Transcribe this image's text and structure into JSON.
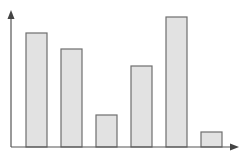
{
  "chart_data": {
    "type": "bar",
    "title": "",
    "xlabel": "",
    "ylabel": "",
    "categories": [
      "",
      "",
      "",
      "",
      "",
      ""
    ],
    "values": [
      114,
      98,
      32,
      81,
      130,
      15
    ],
    "ylim": [
      0,
      137
    ],
    "grid": false,
    "legend": "none",
    "axis_arrows": true,
    "colors": {
      "bar_fill": "#e2e2e2",
      "bar_stroke": "#6e6e6e",
      "axis": "#555555"
    }
  }
}
